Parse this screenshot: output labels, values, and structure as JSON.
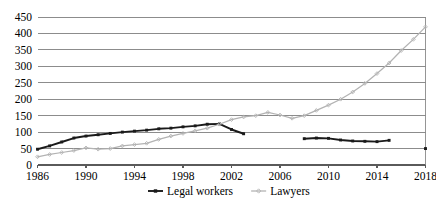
{
  "chart_data": {
    "type": "line",
    "title": "",
    "subtitle": "",
    "xlabel": "",
    "ylabel": "",
    "xlim": [
      1986,
      2018
    ],
    "ylim": [
      0,
      450
    ],
    "grid": true,
    "legend_position": "bottom",
    "y_ticks": [
      0,
      50,
      100,
      150,
      200,
      250,
      300,
      350,
      400,
      450
    ],
    "y_tick_labels": [
      "0",
      "50",
      "100",
      "150",
      "200",
      "250",
      "300",
      "350",
      "400",
      "450"
    ],
    "x_ticks": [
      1986,
      1990,
      1994,
      1998,
      2002,
      2006,
      2010,
      2014,
      2018
    ],
    "x_tick_labels": [
      "1986",
      "1990",
      "1994",
      "1998",
      "2002",
      "2006",
      "2010",
      "2014",
      "2018"
    ],
    "series": [
      {
        "name": "Legal workers",
        "color": "#1a1a1a",
        "marker": "square",
        "segments": [
          {
            "x": [
              1986,
              1987,
              1988,
              1989,
              1990,
              1991,
              1992,
              1993,
              1994,
              1995,
              1996,
              1997,
              1998,
              1999,
              2000,
              2001,
              2002,
              2003
            ],
            "values": [
              48,
              58,
              70,
              82,
              88,
              92,
              96,
              100,
              103,
              106,
              110,
              112,
              116,
              119,
              124,
              125,
              108,
              95
            ]
          },
          {
            "x": [
              2008,
              2009,
              2010,
              2011,
              2012,
              2013,
              2014,
              2015
            ],
            "values": [
              80,
              82,
              81,
              76,
              73,
              72,
              71,
              75
            ]
          },
          {
            "x": [
              2018
            ],
            "values": [
              50
            ]
          }
        ]
      },
      {
        "name": "Lawyers",
        "color": "#b3b3b3",
        "marker": "diamond",
        "segments": [
          {
            "x": [
              1986,
              1987,
              1988,
              1989,
              1990,
              1991,
              1992,
              1993,
              1994,
              1995,
              1996,
              1997,
              1998,
              1999,
              2000,
              2001,
              2002,
              2003,
              2004,
              2005,
              2006,
              2007,
              2008,
              2009,
              2010,
              2011,
              2012,
              2013,
              2014,
              2015,
              2016,
              2017,
              2018
            ],
            "values": [
              25,
              32,
              38,
              44,
              52,
              48,
              50,
              58,
              62,
              66,
              78,
              88,
              96,
              104,
              112,
              124,
              138,
              146,
              150,
              160,
              152,
              142,
              150,
              166,
              182,
              200,
              222,
              248,
              278,
              310,
              348,
              382,
              420
            ]
          }
        ]
      }
    ],
    "legend": [
      {
        "label": "Legal workers",
        "color": "#1a1a1a",
        "marker": "square"
      },
      {
        "label": "Lawyers",
        "color": "#b3b3b3",
        "marker": "diamond"
      }
    ]
  }
}
